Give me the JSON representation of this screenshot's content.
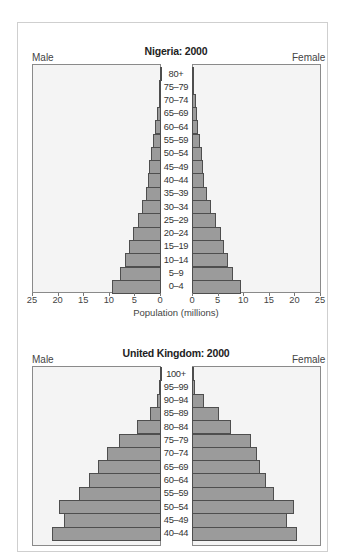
{
  "chart_data": [
    {
      "type": "bar",
      "subtype": "population-pyramid",
      "title": "Nigeria: 2000",
      "left_label": "Male",
      "right_label": "Female",
      "xlabel": "Population (millions)",
      "xlim": [
        0,
        25
      ],
      "xticks": [
        25,
        20,
        15,
        10,
        5,
        0
      ],
      "xticks_right": [
        0,
        5,
        10,
        15,
        20,
        25
      ],
      "categories": [
        "80+",
        "75–79",
        "70–74",
        "65–69",
        "60–64",
        "55–59",
        "50–54",
        "45–49",
        "40–44",
        "35–39",
        "30–34",
        "25–29",
        "20–24",
        "15–19",
        "10–14",
        "5–9",
        "0–4"
      ],
      "series": [
        {
          "name": "Male",
          "values": [
            0.2,
            0.3,
            0.45,
            0.85,
            1.2,
            1.6,
            2.0,
            2.3,
            2.6,
            2.9,
            3.8,
            4.4,
            5.5,
            6.2,
            7.0,
            8.0,
            9.6
          ]
        },
        {
          "name": "Female",
          "values": [
            0.2,
            0.35,
            0.7,
            0.9,
            1.2,
            1.6,
            1.9,
            2.1,
            2.4,
            3.0,
            3.7,
            4.6,
            5.6,
            6.3,
            7.1,
            8.1,
            9.6
          ]
        }
      ],
      "grid": false
    },
    {
      "type": "bar",
      "subtype": "population-pyramid",
      "title": "United Kingdom: 2000",
      "left_label": "Male",
      "right_label": "Female",
      "xlim": [
        0,
        2.5
      ],
      "categories": [
        "100+",
        "95–99",
        "90–94",
        "85–89",
        "80–84",
        "75–79",
        "70–74",
        "65–69",
        "60–64",
        "55–59",
        "50–54",
        "45–49",
        "40–44"
      ],
      "series": [
        {
          "name": "Male",
          "values": [
            0.01,
            0.03,
            0.08,
            0.22,
            0.46,
            0.83,
            1.06,
            1.24,
            1.41,
            1.6,
            2.0,
            1.89,
            2.12
          ]
        },
        {
          "name": "Female",
          "values": [
            0.01,
            0.06,
            0.23,
            0.53,
            0.77,
            1.16,
            1.26,
            1.33,
            1.45,
            1.6,
            2.0,
            1.86,
            2.06
          ]
        }
      ],
      "grid": false
    }
  ]
}
